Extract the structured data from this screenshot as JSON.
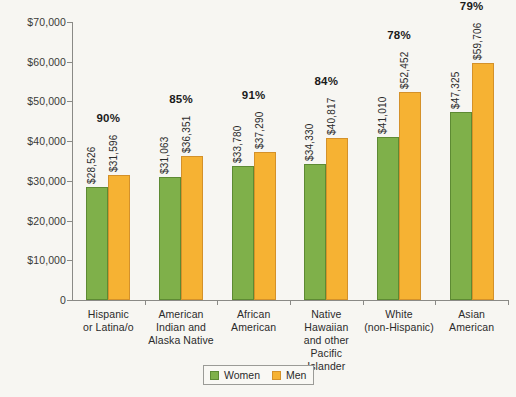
{
  "chart_data": {
    "type": "bar",
    "title": "",
    "subtitle": "",
    "xlabel": "",
    "ylabel": "",
    "ylim": [
      0,
      70000
    ],
    "ytick_step": 10000,
    "grid": false,
    "legend_position": "bottom",
    "categories": [
      "Hispanic\nor Latina/o",
      "American\nIndian and\nAlaska Native",
      "African\nAmerican",
      "Native\nHawaiian\nand other\nPacific Islander",
      "White\n(non-Hispanic)",
      "Asian\nAmerican"
    ],
    "series": [
      {
        "name": "Women",
        "color": "#7fb04a",
        "values": [
          28526,
          31063,
          33780,
          34330,
          41010,
          47325
        ],
        "labels": [
          "$28,526",
          "$31,063",
          "$33,780",
          "$34,330",
          "$41,010",
          "$47,325"
        ]
      },
      {
        "name": "Men",
        "color": "#f6b233",
        "values": [
          31596,
          36351,
          37290,
          40817,
          52452,
          59706
        ],
        "labels": [
          "$31,596",
          "$36,351",
          "$37,290",
          "$40,817",
          "$52,452",
          "$59,706"
        ]
      }
    ],
    "annotations": {
      "name": "ratio-percent",
      "values": [
        "90%",
        "85%",
        "91%",
        "84%",
        "78%",
        "79%"
      ]
    },
    "ytick_labels": [
      "0",
      "$10,000",
      "$20,000",
      "$30,000",
      "$40,000",
      "$50,000",
      "$60,000",
      "$70,000"
    ],
    "ytick_values": [
      0,
      10000,
      20000,
      30000,
      40000,
      50000,
      60000,
      70000
    ]
  },
  "legend": {
    "items": [
      {
        "label": "Women",
        "color": "#7fb04a"
      },
      {
        "label": "Men",
        "color": "#f6b233"
      }
    ]
  },
  "colors": {
    "women": "#7fb04a",
    "men": "#f6b233",
    "axis": "#8a8a86",
    "background": "#f7f6f2"
  }
}
